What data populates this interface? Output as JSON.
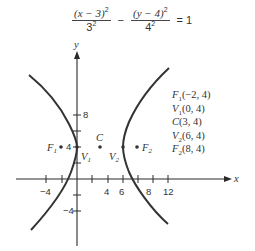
{
  "equation": {
    "term1_num": "(x − 3)",
    "term1_num_exp": "2",
    "term1_den": "3",
    "term1_den_exp": "2",
    "operator": "−",
    "term2_num": "(y − 4)",
    "term2_num_exp": "2",
    "term2_den": "4",
    "term2_den_exp": "2",
    "equals": "= 1"
  },
  "axes": {
    "x_label": "x",
    "y_label": "y",
    "x_tick_labels": [
      "−4",
      "4",
      "6",
      "8",
      "12"
    ],
    "y_tick_labels": [
      "8",
      "4",
      "−4"
    ]
  },
  "points": {
    "F1": {
      "name": "F",
      "sub": "1"
    },
    "V1": {
      "name": "V",
      "sub": "1"
    },
    "C": {
      "name": "C"
    },
    "V2": {
      "name": "V",
      "sub": "2"
    },
    "F2": {
      "name": "F",
      "sub": "2"
    }
  },
  "legend": [
    {
      "name": "F",
      "sub": "1",
      "coords": "(−2, 4)"
    },
    {
      "name": "V",
      "sub": "1",
      "coords": "(0, 4)"
    },
    {
      "name": "C",
      "sub": "",
      "coords": "(3, 4)"
    },
    {
      "name": "V",
      "sub": "2",
      "coords": "(6, 4)"
    },
    {
      "name": "F",
      "sub": "2",
      "coords": "(8, 4)"
    }
  ],
  "colors": {
    "curve": "#333333",
    "axis": "#2a2a2a"
  }
}
